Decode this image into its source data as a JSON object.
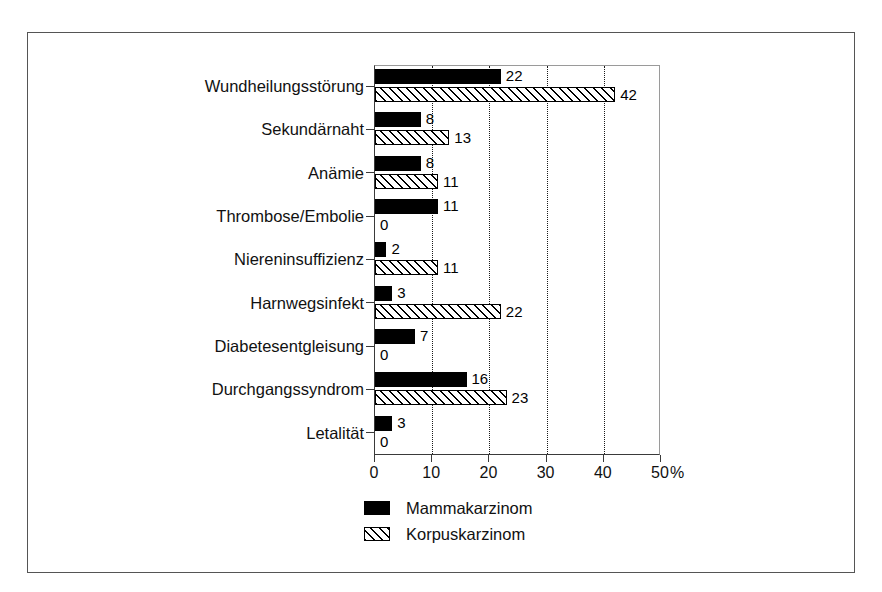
{
  "chart_data": {
    "type": "bar",
    "orientation": "horizontal",
    "title": "",
    "subtitle": "",
    "xlabel": "%",
    "ylabel": "",
    "xlim": [
      0,
      50
    ],
    "xticks": [
      0,
      10,
      20,
      30,
      40,
      50
    ],
    "xtick_labels": [
      "0",
      "10",
      "20",
      "30",
      "40",
      "50"
    ],
    "x_unit_label": "%",
    "grid": "vertical-dotted",
    "legend_position": "bottom-center",
    "categories": [
      "Wundheilungsstörung",
      "Sekundärnaht",
      "Anämie",
      "Thrombose/Embolie",
      "Niereninsuffizienz",
      "Harnwegsinfekt",
      "Diabetesentgleisung",
      "Durchgangssyndrom",
      "Letalität"
    ],
    "series": [
      {
        "name": "Mammakarzinom",
        "fill": "solid-black",
        "color": "#000000",
        "values": [
          22,
          8,
          8,
          11,
          2,
          3,
          7,
          16,
          3
        ],
        "value_labels": [
          "22",
          "8",
          "8",
          "11",
          "2",
          "3",
          "7",
          "16",
          "3"
        ]
      },
      {
        "name": "Korpuskarzinom",
        "fill": "diagonal-hatch",
        "color": "#000000",
        "values": [
          42,
          13,
          11,
          0,
          11,
          22,
          0,
          23,
          0
        ],
        "value_labels": [
          "42",
          "13",
          "11",
          "0",
          "11",
          "22",
          "0",
          "23",
          "0"
        ]
      }
    ]
  },
  "legend": {
    "items": [
      {
        "label": "Mammakarzinom",
        "swatch": "solid-black-swatch"
      },
      {
        "label": "Korpuskarzinom",
        "swatch": "hatched-swatch"
      }
    ]
  }
}
